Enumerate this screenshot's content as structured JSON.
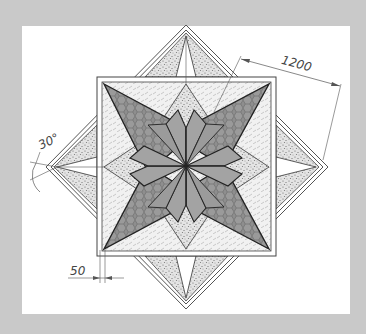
{
  "drawing": {
    "description": "Technical drawing of an eight-point star mosaic pattern inside a square with outer diamond frame",
    "colors": {
      "background": "#c9c9c9",
      "paper": "#ffffff",
      "line": "#333333",
      "dark_fill": "#8e8e8e",
      "mid_fill": "#a3a3a3",
      "speckle_fill": "#dcdcdc",
      "light_fill": "#eeeeee"
    },
    "dimensions": {
      "diagonal_length": "1200",
      "angle": "30°",
      "border_width": "50"
    },
    "materials": [
      {
        "name": "hexagon-pattern",
        "description": "dark gray hexagonal tiles"
      },
      {
        "name": "solid-gray",
        "description": "solid gray center petals"
      },
      {
        "name": "speckled",
        "description": "speckled stone fill"
      },
      {
        "name": "dashed-hatch",
        "description": "light dashed hatch fill"
      }
    ]
  }
}
